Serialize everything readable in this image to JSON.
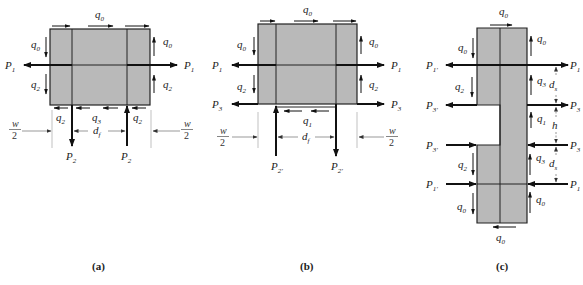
{
  "colors": {
    "panel_fill": "#b9b9b9",
    "stroke": "#222222",
    "dim_line": "#888888"
  },
  "panels": [
    {
      "id": "a",
      "caption": "(a)",
      "shear_flows": {
        "top": "q",
        "top_sub": "0",
        "left_upper": "q",
        "left_upper_sub": "0",
        "left_lower": "q",
        "left_lower_sub": "2",
        "right_upper": "q",
        "right_upper_sub": "0",
        "right_lower": "q",
        "right_lower_sub": "2",
        "bottom_left": "q",
        "bottom_left_sub": "2",
        "bottom_mid": "q",
        "bottom_mid_sub": "3",
        "bottom_right": "q",
        "bottom_right_sub": "2"
      },
      "forces": {
        "left": "P",
        "left_sub": "1",
        "right": "P",
        "right_sub": "1",
        "bottom_left": "P",
        "bottom_left_sub": "2",
        "bottom_right": "P",
        "bottom_right_sub": "2"
      },
      "dimensions": {
        "w_num": "w",
        "w_den": "2",
        "spacing": "d",
        "spacing_sub": "f"
      }
    },
    {
      "id": "b",
      "caption": "(b)",
      "shear_flows": {
        "top": "q",
        "top_sub": "0",
        "left_upper": "q",
        "left_upper_sub": "0",
        "left_lower": "q",
        "left_lower_sub": "2",
        "right_upper": "q",
        "right_upper_sub": "0",
        "right_lower": "q",
        "right_lower_sub": "2",
        "bottom": "q",
        "bottom_sub": "1"
      },
      "forces": {
        "left_upper": "P",
        "left_upper_sub": "1",
        "right_upper": "P",
        "right_upper_sub": "1",
        "left_lower": "P",
        "left_lower_sub": "3",
        "right_lower": "P",
        "right_lower_sub": "3",
        "bottom_left": "P",
        "bottom_left_sub": "2'",
        "bottom_right": "P",
        "bottom_right_sub": "2'"
      },
      "dimensions": {
        "w_num": "w",
        "w_den": "2",
        "spacing": "d",
        "spacing_sub": "f"
      }
    },
    {
      "id": "c",
      "caption": "(c)",
      "shear_flows": {
        "top": "q",
        "top_sub": "0",
        "left_upper": "q",
        "left_upper_sub": "0",
        "right_upper": "q",
        "right_upper_sub": "0",
        "left_mid_upper": "q",
        "left_mid_upper_sub": "2",
        "right_mid_upper": "q",
        "right_mid_upper_sub": "3",
        "right_center": "q",
        "right_center_sub": "1",
        "left_mid_lower": "q",
        "left_mid_lower_sub": "2",
        "right_mid_lower": "q",
        "right_mid_lower_sub": "3",
        "left_lower": "q",
        "left_lower_sub": "0",
        "right_lower": "q",
        "right_lower_sub": "0",
        "bottom": "q",
        "bottom_sub": "0"
      },
      "forces": {
        "left_1": "P",
        "left_1_sub": "1'",
        "right_1": "P",
        "right_1_sub": "1",
        "left_2": "P",
        "left_2_sub": "3'",
        "right_2": "P",
        "right_2_sub": "3",
        "left_3": "P",
        "left_3_sub": "3'",
        "right_3": "P",
        "right_3_sub": "3",
        "left_4": "P",
        "left_4_sub": "1'",
        "right_4": "P",
        "right_4_sub": "1"
      },
      "dimensions": {
        "ds_upper": "d",
        "ds_upper_sub": "s",
        "h": "h",
        "ds_lower": "d",
        "ds_lower_sub": "s"
      }
    }
  ]
}
